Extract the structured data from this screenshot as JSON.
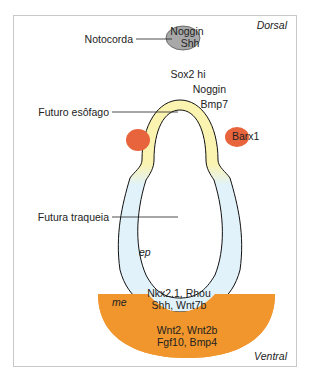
{
  "orientation": {
    "top": "Dorsal",
    "bottom": "Ventral"
  },
  "structures": {
    "notochord": {
      "label": "Notocorda",
      "genes": [
        "Noggin",
        "Shh"
      ],
      "color": "#a8a8a8"
    },
    "esophagus": {
      "label": "Futuro esôfago",
      "genes_top": "Sox2 hi",
      "genes_side_1": "Noggin",
      "genes_side_2": "Bmp7",
      "color": "#fbf4b0"
    },
    "mesenchyme_spots": {
      "gene": "Barx1",
      "color": "#e8643c"
    },
    "trachea": {
      "label": "Futura traqueia",
      "tissue": "ep",
      "genes_1": "Nkx2.1, Rhou",
      "genes_2": "Shh, Wnt7b",
      "color": "#e2f2fa"
    },
    "mesoderm": {
      "tissue": "me",
      "genes_1": "Wnt2, Wnt2b",
      "genes_2": "Fgf10, Bmp4",
      "color": "#f0962c"
    }
  }
}
